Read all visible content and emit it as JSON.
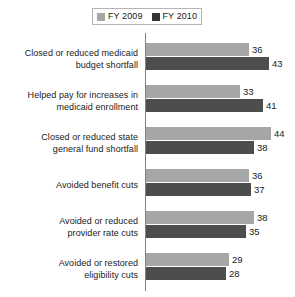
{
  "chart_data": {
    "type": "bar",
    "orientation": "horizontal",
    "title": "",
    "xlabel": "",
    "ylabel": "",
    "xlim": [
      0,
      50
    ],
    "grid": false,
    "legend_position": "top",
    "categories": [
      "Closed or reduced medicaid budget shortfall",
      "Helped pay for increases in medicaid enrollment",
      "Closed or reduced state general fund shortfall",
      "Avoided benefit cuts",
      "Avoided or reduced provider rate cuts",
      "Avoided or restored eligibility cuts"
    ],
    "series": [
      {
        "name": "FY 2009",
        "color": "#a6a6a6",
        "values": [
          36,
          33,
          44,
          36,
          38,
          29
        ]
      },
      {
        "name": "FY 2010",
        "color": "#4d4d4d",
        "values": [
          43,
          41,
          38,
          37,
          35,
          28
        ]
      }
    ]
  },
  "legend": {
    "entries": [
      {
        "label": "FY 2009",
        "swatch": "legend-swatch-fy2009"
      },
      {
        "label": "FY 2010",
        "swatch": "legend-swatch-fy2010"
      }
    ]
  },
  "groups": [
    {
      "label_line1": "Closed or reduced medicaid",
      "label_line2": "budget shortfall",
      "v2009": "36",
      "v2010": "43"
    },
    {
      "label_line1": "Helped pay for increases in",
      "label_line2": "medicaid enrollment",
      "v2009": "33",
      "v2010": "41"
    },
    {
      "label_line1": "Closed or reduced state",
      "label_line2": "general fund shortfall",
      "v2009": "44",
      "v2010": "38"
    },
    {
      "label_line1": "Avoided benefit cuts",
      "label_line2": "",
      "v2009": "36",
      "v2010": "37"
    },
    {
      "label_line1": "Avoided or reduced",
      "label_line2": "provider rate cuts",
      "v2009": "38",
      "v2010": "35"
    },
    {
      "label_line1": "Avoided or restored",
      "label_line2": "eligibility cuts",
      "v2009": "29",
      "v2010": "28"
    }
  ]
}
